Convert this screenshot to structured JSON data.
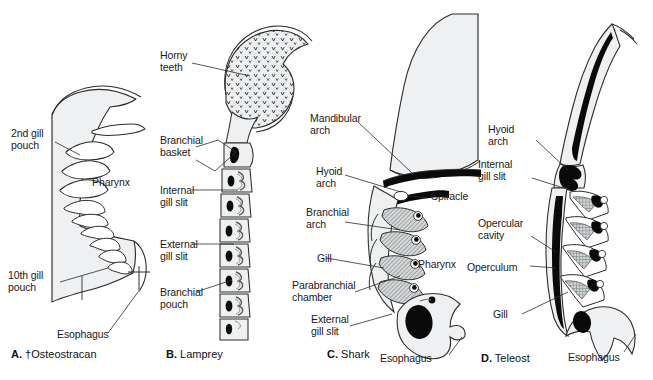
{
  "figure": {
    "background_color": "#ffffff",
    "fill_light": "#eef0f1",
    "fill_mid": "#b9bcbd",
    "fill_dark": "#000000",
    "stroke_color": "#2a2a2a"
  },
  "panels": [
    {
      "id": "A",
      "letter": "A.",
      "caption": "†Osteostracan",
      "extinct": true,
      "labels": [
        {
          "name": "second-gill-pouch",
          "text": "2nd gill\npouch"
        },
        {
          "name": "pharynx",
          "text": "Pharynx"
        },
        {
          "name": "tenth-gill-pouch",
          "text": "10th gill\npouch"
        },
        {
          "name": "esophagus",
          "text": "Esophagus"
        }
      ]
    },
    {
      "id": "B",
      "letter": "B.",
      "caption": "Lamprey",
      "extinct": false,
      "labels": [
        {
          "name": "horny-teeth",
          "text": "Horny\nteeth"
        },
        {
          "name": "branchial-basket",
          "text": "Branchial\nbasket"
        },
        {
          "name": "internal-gill-slit",
          "text": "Internal\ngill slit"
        },
        {
          "name": "external-gill-slit",
          "text": "External\ngill slit"
        },
        {
          "name": "branchial-pouch",
          "text": "Branchial\npouch"
        }
      ]
    },
    {
      "id": "C",
      "letter": "C.",
      "caption": "Shark",
      "extinct": false,
      "labels": [
        {
          "name": "mandibular-arch",
          "text": "Mandibular\narch"
        },
        {
          "name": "hyoid-arch",
          "text": "Hyoid\narch"
        },
        {
          "name": "spiracle",
          "text": "Spiracle"
        },
        {
          "name": "branchial-arch",
          "text": "Branchial\narch"
        },
        {
          "name": "gill",
          "text": "Gill"
        },
        {
          "name": "pharynx",
          "text": "Pharynx"
        },
        {
          "name": "parabranchial-chamber",
          "text": "Parabranchial\nchamber"
        },
        {
          "name": "external-gill-slit",
          "text": "External\ngill slit"
        },
        {
          "name": "esophagus",
          "text": "Esophagus"
        }
      ]
    },
    {
      "id": "D",
      "letter": "D.",
      "caption": "Teleost",
      "extinct": false,
      "labels": [
        {
          "name": "hyoid-arch",
          "text": "Hyoid\narch"
        },
        {
          "name": "internal-gill-slit",
          "text": "Internal\ngill slit"
        },
        {
          "name": "opercular-cavity",
          "text": "Opercular\ncavity"
        },
        {
          "name": "operculum",
          "text": "Operculum"
        },
        {
          "name": "gill",
          "text": "Gill"
        },
        {
          "name": "esophagus",
          "text": "Esophagus"
        }
      ]
    }
  ],
  "text": {
    "a_second_gill_pouch": "2nd gill\npouch",
    "a_pharynx": "Pharynx",
    "a_tenth_gill_pouch": "10th gill\npouch",
    "a_esophagus": "Esophagus",
    "a_letter": "A.",
    "a_caption": " †Osteostracan",
    "b_horny_teeth": "Horny\nteeth",
    "b_branchial_basket": "Branchial\nbasket",
    "b_internal_gill_slit": "Internal\ngill slit",
    "b_external_gill_slit": "External\ngill slit",
    "b_branchial_pouch": "Branchial\npouch",
    "b_letter": "B.",
    "b_caption": " Lamprey",
    "c_mandibular_arch": "Mandibular\narch",
    "c_hyoid_arch": "Hyoid\narch",
    "c_spiracle": "Spiracle",
    "c_branchial_arch": "Branchial\narch",
    "c_gill": "Gill",
    "c_pharynx": "Pharynx",
    "c_parabranchial_chamber": "Parabranchial\nchamber",
    "c_external_gill_slit": "External\ngill slit",
    "c_esophagus": "Esophagus",
    "c_letter": "C.",
    "c_caption": " Shark",
    "d_hyoid_arch": "Hyoid\narch",
    "d_internal_gill_slit": "Internal\ngill slit",
    "d_opercular_cavity": "Opercular\ncavity",
    "d_operculum": "Operculum",
    "d_gill": "Gill",
    "d_esophagus": "Esophagus",
    "d_letter": "D.",
    "d_caption": " Teleost"
  }
}
